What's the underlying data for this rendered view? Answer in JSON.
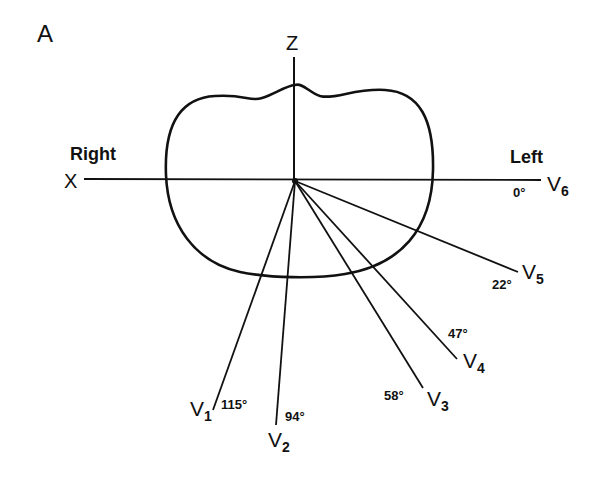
{
  "figure": {
    "panel_label": "A",
    "axes": {
      "z_label": "Z",
      "x_label": "X",
      "right_label": "Right",
      "left_label": "Left"
    },
    "leads": [
      {
        "name": "V",
        "sub": "1",
        "angle": "115°"
      },
      {
        "name": "V",
        "sub": "2",
        "angle": "94°"
      },
      {
        "name": "V",
        "sub": "3",
        "angle": "58°"
      },
      {
        "name": "V",
        "sub": "4",
        "angle": "47°"
      },
      {
        "name": "V",
        "sub": "5",
        "angle": "22°"
      },
      {
        "name": "V",
        "sub": "6",
        "angle": "0°"
      }
    ],
    "stroke_color": "#111111",
    "background": "#ffffff"
  }
}
